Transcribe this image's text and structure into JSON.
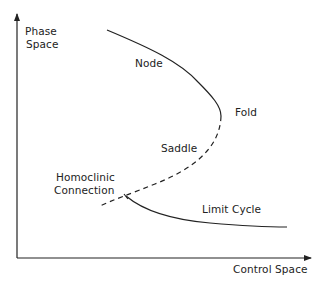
{
  "diagram": {
    "type": "bifurcation-diagram",
    "axes": {
      "y_label_line1": "Phase",
      "y_label_line2": "Space",
      "x_label": "Control Space"
    },
    "labels": {
      "node": "Node",
      "fold": "Fold",
      "saddle": "Saddle",
      "homoclinic_line1": "Homoclinic",
      "homoclinic_line2": "Connection",
      "limit_cycle": "Limit Cycle"
    },
    "branches": [
      {
        "name": "Node",
        "style": "solid"
      },
      {
        "name": "Saddle",
        "style": "dashed"
      },
      {
        "name": "Limit Cycle",
        "style": "solid"
      }
    ],
    "colors": {
      "line": "#222222",
      "background": "#ffffff"
    }
  }
}
